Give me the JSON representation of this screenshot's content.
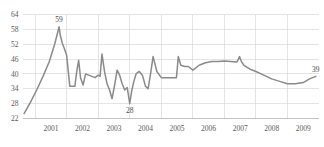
{
  "chart_data": {
    "type": "line",
    "title": "",
    "subtitle": "",
    "xlabel": "",
    "ylabel": "",
    "grid": true,
    "legend": null,
    "legend_position": "none",
    "ylim": [
      22,
      64
    ],
    "yticks": [
      22,
      28,
      34,
      40,
      46,
      52,
      58,
      64
    ],
    "ytick_labels": [
      "22",
      "28",
      "34",
      "40",
      "46",
      "52",
      "58",
      "64"
    ],
    "xlim": [
      2000.6,
      2010.0
    ],
    "xticks": [
      2001,
      2002,
      2003,
      2004,
      2005,
      2006,
      2007,
      2008,
      2009
    ],
    "xtick_labels": [
      "2001",
      "2002",
      "2003",
      "2004",
      "2005",
      "2006",
      "2007",
      "2008",
      "2009"
    ],
    "series": [
      {
        "name": "series-1",
        "color": "#8a8a8a",
        "x": [
          2000.65,
          2000.85,
          2001.05,
          2001.25,
          2001.45,
          2001.62,
          2001.7,
          2001.76,
          2001.8,
          2001.86,
          2001.92,
          2002.0,
          2002.1,
          2002.2,
          2002.26,
          2002.32,
          2002.38,
          2002.44,
          2002.52,
          2002.6,
          2002.7,
          2002.8,
          2002.9,
          2003.0,
          2003.06,
          2003.12,
          2003.2,
          2003.28,
          2003.36,
          2003.44,
          2003.52,
          2003.6,
          2003.68,
          2003.76,
          2003.84,
          2003.92,
          2004.0,
          2004.06,
          2004.12,
          2004.2,
          2004.3,
          2004.4,
          2004.5,
          2004.58,
          2004.66,
          2004.74,
          2004.86,
          2005.0,
          2005.2,
          2005.4,
          2005.48,
          2005.54,
          2005.62,
          2005.74,
          2005.86,
          2006.0,
          2006.2,
          2006.4,
          2006.6,
          2006.8,
          2007.0,
          2007.2,
          2007.4,
          2007.48,
          2007.54,
          2007.62,
          2007.8,
          2008.0,
          2008.25,
          2008.5,
          2008.75,
          2009.0,
          2009.25,
          2009.5,
          2009.7,
          2009.9
        ],
        "y": [
          24.0,
          28.5,
          33.5,
          39.0,
          45.0,
          52.0,
          56.0,
          59.0,
          55.5,
          52.5,
          50.5,
          47.5,
          35.0,
          35.0,
          35.0,
          41.0,
          45.5,
          38.5,
          35.5,
          40.0,
          39.5,
          39.0,
          38.5,
          39.5,
          39.0,
          48.0,
          41.0,
          36.0,
          33.5,
          30.0,
          35.5,
          41.5,
          39.5,
          36.0,
          33.5,
          34.5,
          28.0,
          33.0,
          36.5,
          40.0,
          41.0,
          39.5,
          35.0,
          34.0,
          40.0,
          47.0,
          41.0,
          38.5,
          38.5,
          38.5,
          38.5,
          47.0,
          43.5,
          43.0,
          43.0,
          41.5,
          43.5,
          44.5,
          45.0,
          45.0,
          45.2,
          45.0,
          44.8,
          47.0,
          45.0,
          43.5,
          42.0,
          41.0,
          39.5,
          38.0,
          37.0,
          36.0,
          36.0,
          36.5,
          38.0,
          39.0
        ]
      }
    ],
    "annotations": [
      {
        "text": "59",
        "x": 2001.76,
        "y": 59,
        "position": "above"
      },
      {
        "text": "28",
        "x": 2004.0,
        "y": 28,
        "position": "below"
      },
      {
        "text": "39",
        "x": 2009.9,
        "y": 39,
        "position": "above"
      }
    ]
  }
}
